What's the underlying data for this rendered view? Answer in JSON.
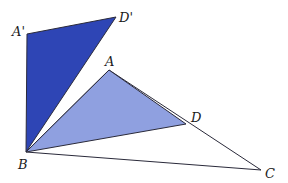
{
  "diagram": {
    "colors": {
      "dark_triangle": "#2e45b5",
      "light_triangle": "#8fa0e0",
      "stroke": "#2a2a3a"
    },
    "points": {
      "A_prime": {
        "label": "A'",
        "x": 27,
        "y": 34
      },
      "D_prime": {
        "label": "D'",
        "x": 116,
        "y": 17
      },
      "B": {
        "label": "B",
        "x": 26,
        "y": 152
      },
      "A": {
        "label": "A",
        "x": 109,
        "y": 70
      },
      "D": {
        "label": "D",
        "x": 186,
        "y": 124
      },
      "C": {
        "label": "C",
        "x": 261,
        "y": 170
      }
    },
    "shapes": [
      {
        "name": "triangle-A'BD'",
        "vertices": [
          "A'",
          "B",
          "D'"
        ],
        "fill": "dark"
      },
      {
        "name": "triangle-ABD",
        "vertices": [
          "A",
          "B",
          "D"
        ],
        "fill": "light"
      },
      {
        "name": "triangle-ABC",
        "vertices": [
          "A",
          "B",
          "C"
        ],
        "fill": "none"
      }
    ]
  }
}
